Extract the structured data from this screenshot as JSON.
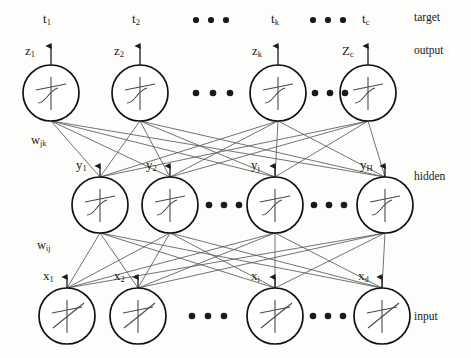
{
  "figure": {
    "kind": "neural-network-diagram",
    "width": 471,
    "height": 358,
    "background": "#fdfdfc",
    "ink": "#1a1a1a",
    "line": "#555555"
  },
  "layer_labels": {
    "target": "target",
    "output": "output",
    "hidden": "hidden",
    "input": "input"
  },
  "targets": [
    {
      "base": "t",
      "sub": "1"
    },
    {
      "base": "t",
      "sub": "2"
    },
    {
      "base": "t",
      "sub": "k"
    },
    {
      "base": "t",
      "sub": "c"
    }
  ],
  "outputs": [
    {
      "base": "z",
      "sub": "1"
    },
    {
      "base": "z",
      "sub": "2"
    },
    {
      "base": "z",
      "sub": "k"
    },
    {
      "base": "Z",
      "sub": "c"
    }
  ],
  "hidden": [
    {
      "base": "y",
      "sub": "1"
    },
    {
      "base": "y",
      "sub": "2"
    },
    {
      "base": "y",
      "sub": "j"
    },
    {
      "base": "y",
      "sub": "H"
    }
  ],
  "inputs": [
    {
      "base": "x",
      "sub": "1"
    },
    {
      "base": "x",
      "sub": "2"
    },
    {
      "base": "x",
      "sub": "i"
    },
    {
      "base": "x",
      "sub": "d"
    }
  ],
  "weights": [
    {
      "base": "w",
      "sub": "jk"
    },
    {
      "base": "w",
      "sub": "ij"
    }
  ],
  "ellipses": [
    {
      "row": "target",
      "dots": 3
    },
    {
      "row": "output-left",
      "dots": 3
    },
    {
      "row": "output-right",
      "dots": 3
    },
    {
      "row": "hidden-left",
      "dots": 3
    },
    {
      "row": "hidden-right",
      "dots": 3
    },
    {
      "row": "input-left",
      "dots": 3
    },
    {
      "row": "input-right",
      "dots": 3
    }
  ],
  "geometry": {
    "output_y": 93,
    "hidden_y": 205,
    "input_y": 316,
    "radius": 28,
    "output_x": [
      51,
      140,
      278,
      368
    ],
    "hidden_x": [
      100,
      170,
      275,
      385
    ],
    "input_x": [
      67,
      138,
      275,
      382
    ]
  }
}
